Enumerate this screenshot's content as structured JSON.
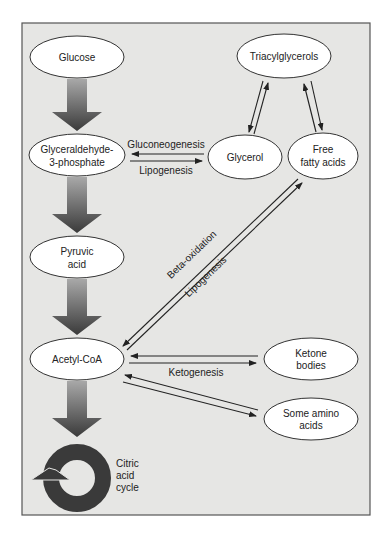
{
  "diagram": {
    "colors": {
      "background": "#e6e6e4",
      "frame": "#555555",
      "node_fill": "#ffffff",
      "arrow": "#222222",
      "big_arrow_dark": "#3a3a3a",
      "big_arrow_light": "#9a9a9a"
    },
    "nodes": {
      "glucose": "Glucose",
      "triacylglycerols": "Triacylglycerols",
      "glyceraldehyde_line1": "Glyceraldehyde-",
      "glyceraldehyde_line2": "3-phosphate",
      "glycerol": "Glycerol",
      "ffa_line1": "Free",
      "ffa_line2": "fatty acids",
      "pyruvic_line1": "Pyruvic",
      "pyruvic_line2": "acid",
      "acetyl": "Acetyl-CoA",
      "ketone_line1": "Ketone",
      "ketone_line2": "bodies",
      "amino_line1": "Some amino",
      "amino_line2": "acids",
      "cycle_line1": "Citric",
      "cycle_line2": "acid",
      "cycle_line3": "cycle"
    },
    "edge_labels": {
      "gluconeogenesis": "Gluconeogenesis",
      "lipogenesis_top": "Lipogenesis",
      "beta_oxidation": "Beta-oxidation",
      "lipogenesis_diag": "Lipogenesis",
      "ketogenesis": "Ketogenesis"
    }
  }
}
